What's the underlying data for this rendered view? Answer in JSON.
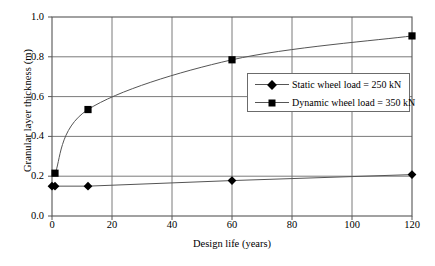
{
  "chart_data": {
    "type": "line",
    "title": "",
    "xlabel": "Design life (years)",
    "ylabel": "Granular layer thickness (m)",
    "xlim": [
      0,
      120
    ],
    "ylim": [
      0.0,
      1.0
    ],
    "xticks": [
      0,
      20,
      40,
      60,
      80,
      100,
      120
    ],
    "xtick_labels": [
      "0",
      "20",
      "40",
      "60",
      "80",
      "100",
      "120"
    ],
    "yticks": [
      0.0,
      0.2,
      0.4,
      0.6,
      0.8,
      1.0
    ],
    "ytick_labels": [
      "0.0",
      "0.2",
      "0.4",
      "0.6",
      "0.8",
      "1.0"
    ],
    "grid": true,
    "legend_position": "center-right",
    "series": [
      {
        "name": "Static wheel load = 250 kN",
        "marker": "diamond",
        "color": "#000000",
        "x": [
          0,
          1,
          12,
          60,
          120
        ],
        "values": [
          0.15,
          0.15,
          0.15,
          0.178,
          0.208
        ]
      },
      {
        "name": "Dynamic wheel load = 350 kN",
        "marker": "square",
        "color": "#000000",
        "x": [
          1,
          12,
          60,
          120
        ],
        "values": [
          0.215,
          0.535,
          0.785,
          0.905
        ]
      }
    ]
  },
  "legend": {
    "items": [
      {
        "label": "Static wheel load = 250 kN",
        "marker": "diamond"
      },
      {
        "label": "Dynamic wheel load = 350 kN",
        "marker": "square"
      }
    ]
  }
}
